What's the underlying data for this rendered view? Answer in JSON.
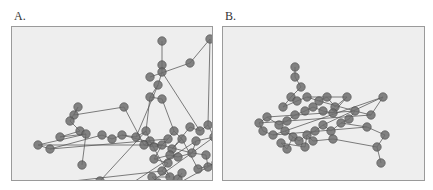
{
  "figure": {
    "panels": [
      {
        "label": "A.",
        "nodes": [
          [
            150,
            14
          ],
          [
            178,
            36
          ],
          [
            198,
            12
          ],
          [
            150,
            38
          ],
          [
            138,
            50
          ],
          [
            150,
            45
          ],
          [
            146,
            58
          ],
          [
            138,
            70
          ],
          [
            150,
            72
          ],
          [
            112,
            80
          ],
          [
            62,
            88
          ],
          [
            66,
            80
          ],
          [
            58,
            94
          ],
          [
            68,
            104
          ],
          [
            48,
            110
          ],
          [
            74,
            107
          ],
          [
            26,
            118
          ],
          [
            38,
            122
          ],
          [
            90,
            108
          ],
          [
            100,
            112
          ],
          [
            110,
            108
          ],
          [
            124,
            110
          ],
          [
            134,
            104
          ],
          [
            138,
            114
          ],
          [
            132,
            118
          ],
          [
            142,
            120
          ],
          [
            150,
            118
          ],
          [
            156,
            112
          ],
          [
            162,
            104
          ],
          [
            170,
            112
          ],
          [
            160,
            122
          ],
          [
            178,
            100
          ],
          [
            188,
            104
          ],
          [
            196,
            98
          ],
          [
            202,
            110
          ],
          [
            184,
            114
          ],
          [
            180,
            126
          ],
          [
            194,
            128
          ],
          [
            196,
            140
          ],
          [
            204,
            136
          ],
          [
            186,
            142
          ],
          [
            70,
            138
          ],
          [
            142,
            132
          ],
          [
            156,
            136
          ],
          [
            150,
            144
          ],
          [
            158,
            150
          ],
          [
            140,
            150
          ],
          [
            146,
            156
          ],
          [
            152,
            164
          ],
          [
            162,
            158
          ],
          [
            166,
            152
          ],
          [
            170,
            146
          ],
          [
            158,
            128
          ],
          [
            166,
            130
          ],
          [
            156,
            174
          ],
          [
            124,
            166
          ],
          [
            132,
            160
          ],
          [
            108,
            164
          ],
          [
            98,
            168
          ],
          [
            104,
            174
          ],
          [
            118,
            176
          ],
          [
            138,
            172
          ],
          [
            148,
            180
          ],
          [
            8,
            160
          ],
          [
            88,
            154
          ],
          [
            78,
            164
          ],
          [
            130,
            182
          ]
        ],
        "edges": [
          [
            0,
            3
          ],
          [
            3,
            5
          ],
          [
            5,
            6
          ],
          [
            6,
            7
          ],
          [
            7,
            8
          ],
          [
            1,
            2
          ],
          [
            1,
            4
          ],
          [
            2,
            33
          ],
          [
            9,
            10
          ],
          [
            10,
            11
          ],
          [
            11,
            12
          ],
          [
            12,
            13
          ],
          [
            13,
            14
          ],
          [
            14,
            15
          ],
          [
            15,
            16
          ],
          [
            16,
            17
          ],
          [
            17,
            18
          ],
          [
            18,
            19
          ],
          [
            19,
            20
          ],
          [
            20,
            21
          ],
          [
            21,
            22
          ],
          [
            22,
            23
          ],
          [
            23,
            24
          ],
          [
            24,
            25
          ],
          [
            25,
            26
          ],
          [
            26,
            27
          ],
          [
            27,
            28
          ],
          [
            28,
            29
          ],
          [
            29,
            30
          ],
          [
            30,
            31
          ],
          [
            31,
            32
          ],
          [
            32,
            33
          ],
          [
            33,
            34
          ],
          [
            34,
            35
          ],
          [
            35,
            36
          ],
          [
            36,
            37
          ],
          [
            37,
            38
          ],
          [
            38,
            39
          ],
          [
            39,
            40
          ],
          [
            15,
            41
          ],
          [
            26,
            42
          ],
          [
            42,
            43
          ],
          [
            43,
            44
          ],
          [
            44,
            45
          ],
          [
            45,
            46
          ],
          [
            46,
            47
          ],
          [
            47,
            48
          ],
          [
            48,
            49
          ],
          [
            49,
            50
          ],
          [
            50,
            51
          ],
          [
            42,
            52
          ],
          [
            52,
            53
          ],
          [
            53,
            36
          ],
          [
            48,
            54
          ],
          [
            55,
            56
          ],
          [
            56,
            57
          ],
          [
            57,
            58
          ],
          [
            58,
            59
          ],
          [
            59,
            60
          ],
          [
            60,
            61
          ],
          [
            61,
            62
          ],
          [
            63,
            64
          ],
          [
            64,
            65
          ],
          [
            65,
            66
          ],
          [
            6,
            21
          ],
          [
            7,
            22
          ],
          [
            8,
            28
          ],
          [
            9,
            24
          ],
          [
            5,
            32
          ],
          [
            23,
            45
          ],
          [
            44,
            63
          ],
          [
            55,
            34
          ],
          [
            16,
            26
          ],
          [
            17,
            27
          ],
          [
            20,
            36
          ],
          [
            29,
            40
          ],
          [
            38,
            61
          ],
          [
            57,
            35
          ],
          [
            64,
            22
          ]
        ]
      },
      {
        "label": "B.",
        "nodes": [
          [
            72,
            40
          ],
          [
            72,
            50
          ],
          [
            78,
            60
          ],
          [
            68,
            70
          ],
          [
            60,
            80
          ],
          [
            74,
            74
          ],
          [
            84,
            70
          ],
          [
            96,
            74
          ],
          [
            104,
            70
          ],
          [
            112,
            80
          ],
          [
            124,
            70
          ],
          [
            110,
            86
          ],
          [
            100,
            84
          ],
          [
            90,
            80
          ],
          [
            82,
            84
          ],
          [
            72,
            88
          ],
          [
            64,
            94
          ],
          [
            56,
            98
          ],
          [
            44,
            90
          ],
          [
            36,
            96
          ],
          [
            40,
            104
          ],
          [
            50,
            108
          ],
          [
            62,
            104
          ],
          [
            70,
            110
          ],
          [
            76,
            114
          ],
          [
            84,
            108
          ],
          [
            92,
            104
          ],
          [
            100,
            98
          ],
          [
            108,
            104
          ],
          [
            118,
            96
          ],
          [
            126,
            92
          ],
          [
            132,
            84
          ],
          [
            148,
            88
          ],
          [
            160,
            70
          ],
          [
            144,
            100
          ],
          [
            162,
            108
          ],
          [
            154,
            120
          ],
          [
            158,
            136
          ],
          [
            90,
            114
          ],
          [
            64,
            122
          ],
          [
            58,
            116
          ],
          [
            82,
            120
          ],
          [
            110,
            112
          ]
        ],
        "edges": [
          [
            0,
            1
          ],
          [
            1,
            2
          ],
          [
            2,
            3
          ],
          [
            3,
            4
          ],
          [
            4,
            5
          ],
          [
            5,
            6
          ],
          [
            6,
            7
          ],
          [
            7,
            8
          ],
          [
            8,
            9
          ],
          [
            9,
            10
          ],
          [
            10,
            11
          ],
          [
            11,
            12
          ],
          [
            12,
            13
          ],
          [
            13,
            14
          ],
          [
            14,
            15
          ],
          [
            15,
            16
          ],
          [
            16,
            17
          ],
          [
            17,
            18
          ],
          [
            18,
            19
          ],
          [
            19,
            20
          ],
          [
            20,
            21
          ],
          [
            21,
            22
          ],
          [
            22,
            23
          ],
          [
            23,
            24
          ],
          [
            24,
            25
          ],
          [
            25,
            26
          ],
          [
            26,
            27
          ],
          [
            27,
            28
          ],
          [
            28,
            29
          ],
          [
            29,
            30
          ],
          [
            30,
            31
          ],
          [
            31,
            32
          ],
          [
            32,
            33
          ],
          [
            33,
            27
          ],
          [
            29,
            34
          ],
          [
            34,
            35
          ],
          [
            35,
            36
          ],
          [
            36,
            37
          ],
          [
            25,
            38
          ],
          [
            38,
            42
          ],
          [
            23,
            39
          ],
          [
            39,
            40
          ],
          [
            40,
            41
          ],
          [
            41,
            25
          ],
          [
            18,
            31
          ],
          [
            19,
            32
          ],
          [
            22,
            33
          ],
          [
            21,
            34
          ],
          [
            42,
            36
          ],
          [
            6,
            10
          ],
          [
            7,
            31
          ]
        ]
      }
    ]
  }
}
